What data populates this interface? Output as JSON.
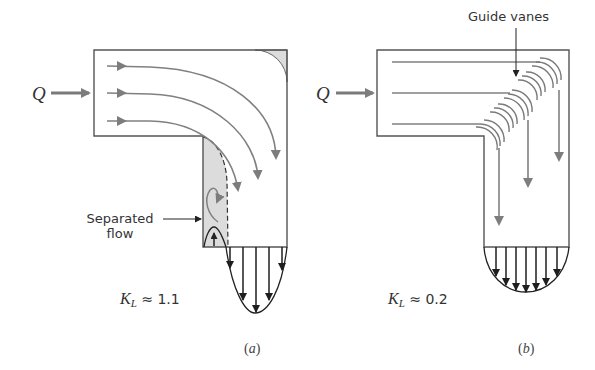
{
  "figure": {
    "panels": [
      {
        "id": "a",
        "caption": "a",
        "inlet_label": "Q",
        "loss_coefficient": {
          "symbol": "K",
          "subscript": "L",
          "approx": "≈",
          "value": "1.1"
        },
        "annotations": [
          {
            "text_line1": "Separated",
            "text_line2": "flow"
          }
        ],
        "description": "Sharp 90° bend without guide vanes; flow separates at inner corner"
      },
      {
        "id": "b",
        "caption": "b",
        "inlet_label": "Q",
        "loss_coefficient": {
          "symbol": "K",
          "subscript": "L",
          "approx": "≈",
          "value": "0.2"
        },
        "annotations": [
          {
            "text": "Guide vanes"
          }
        ],
        "description": "90° bend with guide vanes; uniform outlet velocity profile"
      }
    ],
    "colors": {
      "outline": "#555555",
      "streamline": "#808080",
      "shade": "#dcdcdc",
      "profile": "#222222",
      "inlet_arrow": "#7a7a7a"
    }
  }
}
